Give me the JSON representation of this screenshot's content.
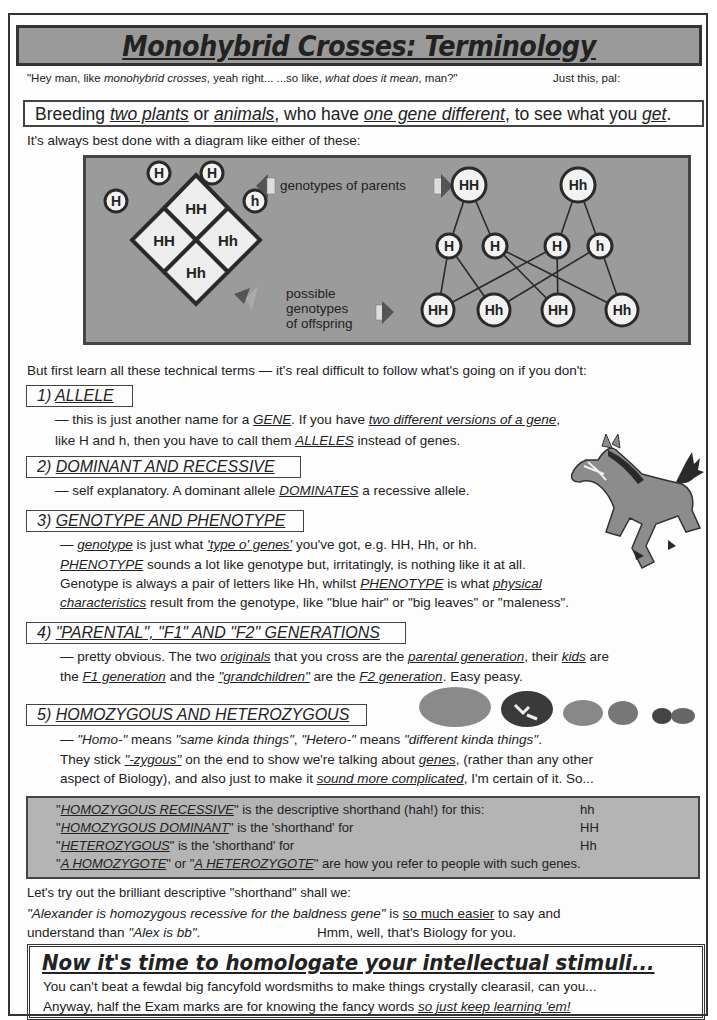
{
  "title": "Monohybrid Crosses: Terminology",
  "intro": {
    "prefix": "\"Hey man, like ",
    "em1": "monohybrid crosses",
    "mid": ", yeah right...  ...so like, ",
    "em2": "what does it mean",
    "suffix": ", man?\"",
    "right": "Just this, pal:"
  },
  "definition": {
    "a": "Breeding ",
    "b": "two plants",
    "c": " or ",
    "d": "animals",
    "e": ", who have ",
    "f": "one gene different",
    "g": ", to see what you ",
    "h": "get",
    "i": "."
  },
  "diagram_intro": "It's always best done with a diagram like either of these:",
  "diagram": {
    "label_parents": "genotypes of parents",
    "label_offspring_1": "possible",
    "label_offspring_2": "genotypes",
    "label_offspring_3": "of offspring",
    "punnett": {
      "top_alleles": [
        "H",
        "H"
      ],
      "left_alleles": [
        "H",
        "h"
      ],
      "cells": [
        "HH",
        "HH",
        "Hh",
        "Hh"
      ]
    },
    "tree": {
      "parents": [
        "HH",
        "Hh"
      ],
      "gametes": [
        "H",
        "H",
        "H",
        "h"
      ],
      "offspring": [
        "HH",
        "Hh",
        "HH",
        "Hh"
      ]
    }
  },
  "learn_terms": "But first learn all these technical terms — it's real difficult to follow what's going on if you don't:",
  "sections": [
    {
      "num": "1) ",
      "title": "ALLELE",
      "l1a": "— this is just another name for a ",
      "l1b": "GENE",
      "l1c": ".  If you have ",
      "l1d": "two different versions of a gene",
      "l1e": ",",
      "l2a": "like H and h, then you have to call them ",
      "l2b": "ALLELES",
      "l2c": " instead of genes."
    },
    {
      "num": "2) ",
      "title": "DOMINANT AND RECESSIVE",
      "l1a": "— self explanatory.  A dominant allele ",
      "l1b": "DOMINATES",
      "l1c": " a recessive allele."
    },
    {
      "num": "3) ",
      "title": "GENOTYPE AND PHENOTYPE",
      "l1a": "— ",
      "l1b": "genotype",
      "l1c": " is just what ",
      "l1d": "'type o' genes'",
      "l1e": " you've got, e.g.  HH, Hh, or hh.",
      "l2a": "PHENOTYPE",
      "l2b": " sounds a lot like genotype but, irritatingly, is nothing like it at all.",
      "l3a": "Genotype is always a pair of letters like Hh, whilst ",
      "l3b": "PHENOTYPE",
      "l3c": " is what ",
      "l3d": "physical",
      "l4a": "characteristics",
      "l4b": " result from the genotype, like \"blue hair\" or \"big leaves\" or \"maleness\"."
    },
    {
      "num": "4) ",
      "title": "\"PARENTAL\", \"F1\" AND \"F2\" GENERATIONS",
      "l1a": "— pretty obvious.  The two ",
      "l1b": "originals",
      "l1c": " that you cross are the ",
      "l1d": "parental generation",
      "l1e": ", their ",
      "l1f": "kids",
      "l1g": " are",
      "l2a": "the ",
      "l2b": "F1 generation",
      "l2c": " and the ",
      "l2d": "\"grandchildren\"",
      "l2e": " are the ",
      "l2f": "F2 generation",
      "l2g": ".  Easy peasy."
    },
    {
      "num": "5) ",
      "title": "HOMOZYGOUS AND HETEROZYGOUS",
      "l1a": "— ",
      "l1b": "\"Homo-\"",
      "l1c": " means ",
      "l1d": "\"same kinda things\"",
      "l1e": ",  ",
      "l1f": "\"Hetero-\"",
      "l1g": " means ",
      "l1h": "\"different kinda things\"",
      "l1i": ".",
      "l2a": "They stick ",
      "l2b": "\"-zygous\"",
      "l2c": " on the end to show we're talking about ",
      "l2d": "genes",
      "l2e": ", (rather than any other",
      "l3a": "aspect of Biology), and also just to make it ",
      "l3b": "sound more complicated",
      "l3c": ", I'm certain of it.  So..."
    }
  ],
  "shorthand": [
    {
      "term": "HOMOZYGOUS RECESSIVE",
      "text": "\" is the descriptive shorthand (hah!) for this:",
      "value": "hh"
    },
    {
      "term": "HOMOZYGOUS DOMINANT",
      "text": "\" is the 'shorthand' for",
      "value": "HH"
    },
    {
      "term": "HETEROZYGOUS",
      "text": "\"  is the 'shorthand' for",
      "value": "Hh"
    }
  ],
  "shorthand_last": {
    "a": "A HOMOZYGOTE",
    "b": "\" or \"",
    "c": "A HETEROZYGOTE",
    "d": "\" are how you refer to people with such genes."
  },
  "tryout": "Let's try out the brilliant descriptive \"shorthand\" shall we:",
  "example": {
    "q1": "\"Alexander is homozygous recessive for the baldness gene\"",
    "t1": "  is ",
    "u1": "so much easier",
    "t2": " to say and",
    "t3": "understand than   ",
    "q2": "\"Alex is bb\"",
    "t4": ".",
    "t5": "Hmm, well, that's Biology for you."
  },
  "final": {
    "heading": "Now it's time to homologate your intellectual stimuli...",
    "line1": "You can't beat a fewdal big fancyfold wordsmiths to make things crystally clearasil, can you...",
    "line2a": "Anyway, half the Exam marks are for knowing the fancy words ",
    "line2b": "so just keep learning 'em!"
  }
}
